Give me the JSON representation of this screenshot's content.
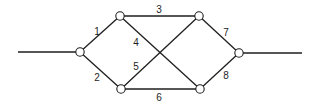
{
  "diagram": {
    "type": "network-graph",
    "colors": {
      "line": "#1e1e1e",
      "node_fill": "#ffffff",
      "background": "#ffffff"
    },
    "nodes": [
      {
        "id": "left",
        "x": 80,
        "y": 52
      },
      {
        "id": "top-left",
        "x": 120,
        "y": 16
      },
      {
        "id": "top-right",
        "x": 199,
        "y": 16
      },
      {
        "id": "bottom-left",
        "x": 121,
        "y": 89
      },
      {
        "id": "bottom-right",
        "x": 200,
        "y": 89
      },
      {
        "id": "right",
        "x": 239,
        "y": 53
      }
    ],
    "leads": [
      {
        "id": "input",
        "from": [
          18,
          52
        ],
        "to": "left"
      },
      {
        "id": "output",
        "from": "right",
        "to": [
          302,
          53
        ]
      }
    ],
    "edges": [
      {
        "label": "1",
        "from": "left",
        "to": "top-left",
        "label_pos": [
          97,
          31
        ]
      },
      {
        "label": "2",
        "from": "left",
        "to": "bottom-left",
        "label_pos": [
          97,
          77
        ]
      },
      {
        "label": "3",
        "from": "top-left",
        "to": "top-right",
        "label_pos": [
          159,
          9
        ]
      },
      {
        "label": "4",
        "from": "top-left",
        "to": "bottom-right",
        "label_pos": [
          136,
          42
        ]
      },
      {
        "label": "5",
        "from": "bottom-left",
        "to": "top-right",
        "label_pos": [
          136,
          66
        ]
      },
      {
        "label": "6",
        "from": "bottom-left",
        "to": "bottom-right",
        "label_pos": [
          159,
          97
        ]
      },
      {
        "label": "7",
        "from": "top-right",
        "to": "right",
        "label_pos": [
          226,
          32
        ]
      },
      {
        "label": "8",
        "from": "bottom-right",
        "to": "right",
        "label_pos": [
          226,
          75
        ]
      }
    ]
  }
}
